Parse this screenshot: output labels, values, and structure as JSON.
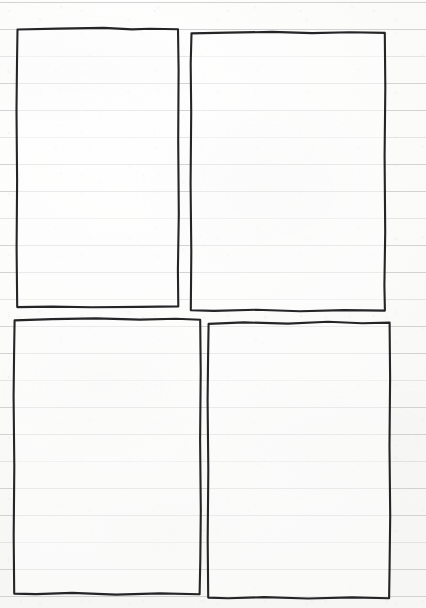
{
  "page": {
    "kind": "scanned-ruled-notebook-page",
    "width": 426,
    "height": 608,
    "background_color": "#fdfdfc",
    "has_visible_text": false
  },
  "paper": {
    "color": "#fdfdfc",
    "rule_color": "#c9c9cb",
    "rule_spacing_px": 27,
    "first_rule_y": 2,
    "rule_count": 23,
    "rule_ys": [
      2,
      29,
      56,
      83,
      110,
      137,
      164,
      191,
      218,
      245,
      272,
      299,
      326,
      353,
      380,
      407,
      434,
      461,
      488,
      515,
      542,
      569,
      596
    ]
  },
  "frames": {
    "ink_color": "#252528",
    "stroke_width": 2.1,
    "count": 4,
    "items": [
      {
        "name": "top-left-frame",
        "position": "top-left",
        "x": 16,
        "y": 28,
        "width": 162,
        "height": 279,
        "content": "",
        "path": "M17.5,29.5 L58,28.6 L104,27.9 L132,29.4 L150,28.8 L178,29.2 L178.6,70 L178.2,140 L178.8,214 L177.9,270 L178.3,306.4 L140,306.9 L92,307.2 L52,306.6 L17.2,307.1 L16.6,248 L17.1,180 L16.5,110 L17.0,62 Z"
      },
      {
        "name": "top-right-frame",
        "position": "top-right",
        "x": 190,
        "y": 31,
        "width": 195,
        "height": 280,
        "content": "",
        "path": "M191.5,33.4 L228,32.6 L272,31.9 L312,33.1 L350,32.2 L384.8,32.9 L385.3,88 L384.6,156 L385.2,232 L384.4,286 L384.9,310.6 L344,310.1 L300,311.3 L256,309.8 L214,310.9 L190.8,310.3 L191.3,252 L190.6,184 L191.2,112 L190.7,64 Z"
      },
      {
        "name": "bottom-left-frame",
        "position": "bottom-left",
        "x": 13,
        "y": 318,
        "width": 188,
        "height": 277,
        "content": "",
        "path": "M14.6,320.4 L52,319.1 L96,318.4 L140,319.6 L176,318.7 L200.2,319.8 L200.7,372 L200.1,440 L200.8,510 L200.3,560 L199.6,594.2 L160,593.4 L116,594.6 L72,592.9 L36,594.1 L14.2,593.6 L13.7,536 L14.3,466 L13.6,396 L14.1,352 Z"
      },
      {
        "name": "bottom-right-frame",
        "position": "bottom-right",
        "x": 207,
        "y": 321,
        "width": 183,
        "height": 278,
        "content": "",
        "path": "M208.6,323.9 L244,322.4 L288,323.6 L328,321.8 L362,323.2 L389.6,322.6 L390.1,378 L389.5,446 L390.2,516 L389.6,566 L389.1,598.2 L352,597.4 L308,598.5 L264,597.1 L228,598.3 L208.2,597.6 L207.7,540 L208.3,470 L207.6,400 L208.1,356 Z"
      }
    ]
  }
}
